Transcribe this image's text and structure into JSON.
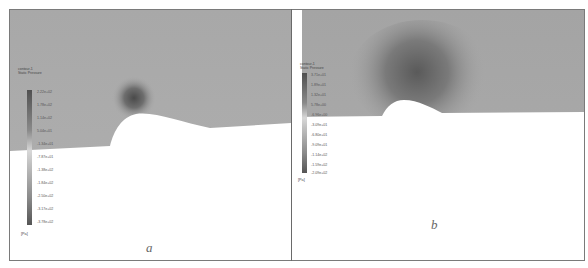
{
  "figure": {
    "panels": [
      {
        "id": "a",
        "caption": "a",
        "legend": {
          "title_line1": "contour-1",
          "title_line2": "Static Pressure",
          "ticks": [
            "2.22e+02",
            "1.78e+02",
            "1.14e+02",
            "5.04e+01",
            "-1.34e+01",
            "-7.87e+01",
            "-1.38e+02",
            "-1.84e+02",
            "-2.50e+02",
            "-3.17e+02",
            "-3.78e+02"
          ],
          "unit": "[Pa]"
        }
      },
      {
        "id": "b",
        "caption": "b",
        "legend": {
          "title_line1": "contour-1",
          "title_line2": "Static Pressure",
          "ticks": [
            "3.71e+01",
            "1.89e+01",
            "1.32e+01",
            "5.78e+00",
            "-6.96e+00",
            "-3.09e+01",
            "-6.80e+01",
            "-9.09e+01",
            "-1.14e+02",
            "-1.59e+02",
            "-2.09e+02"
          ],
          "unit": "[Pa]"
        }
      }
    ],
    "colors": {
      "field_base": "#a9a9a9",
      "low_pressure": "#555555",
      "ground": "#ffffff",
      "border": "#7a7a7a"
    }
  }
}
